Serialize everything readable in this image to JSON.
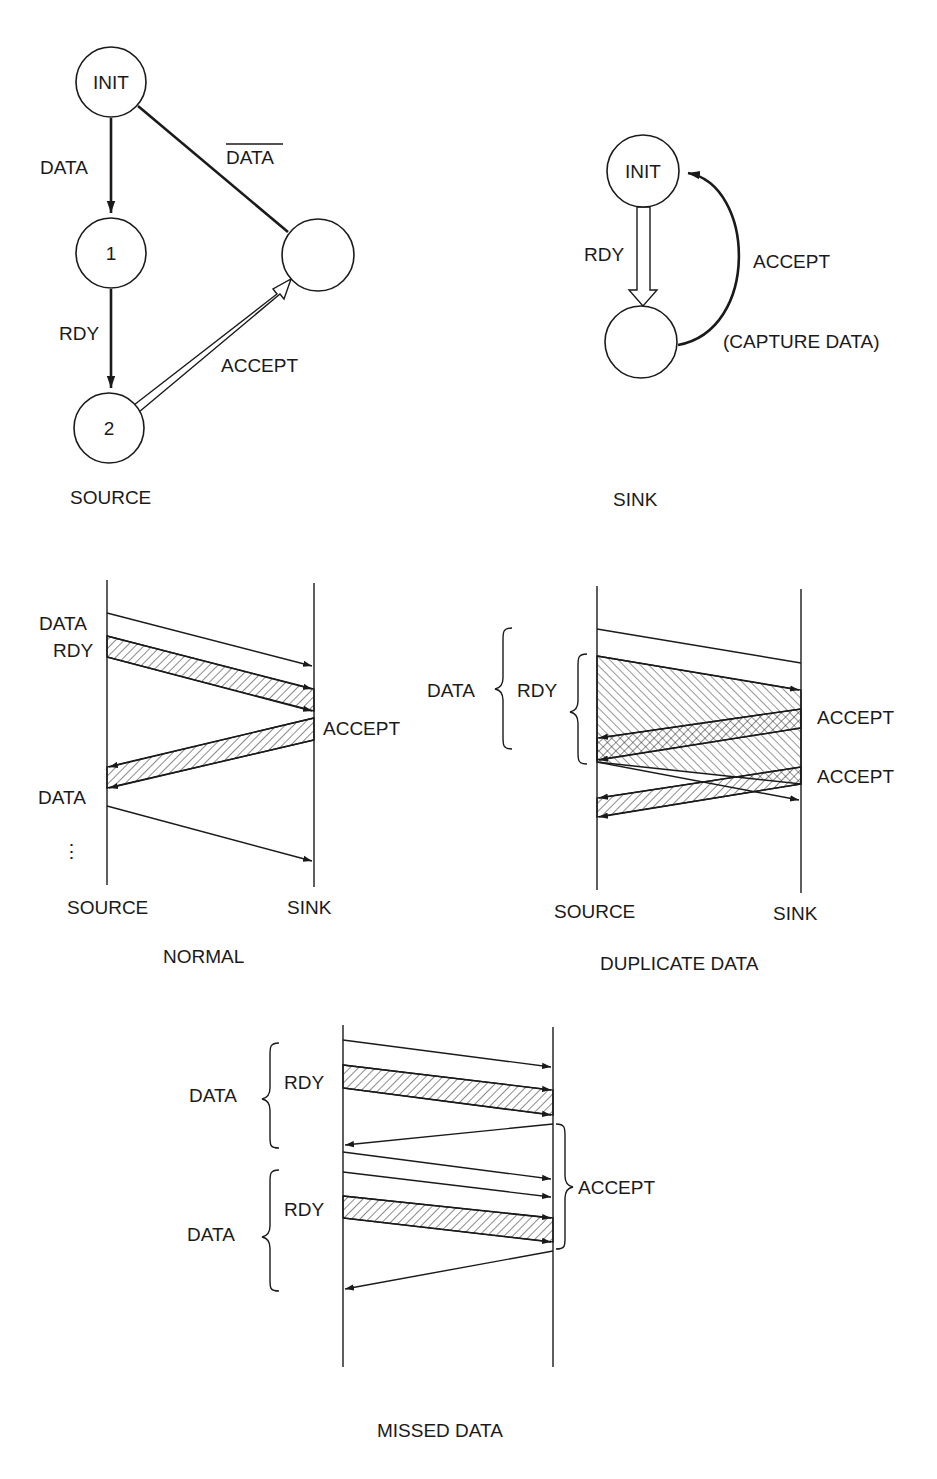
{
  "source_fsm": {
    "caption": "SOURCE",
    "nodes": {
      "init": "INIT",
      "one": "1",
      "two": "2",
      "unnamed": ""
    },
    "edges": {
      "init_to_1": "DATA",
      "init_to_unnamed": "DATA",
      "one_to_2": "RDY",
      "two_to_unnamed": "ACCEPT"
    },
    "overbar_on": "init_to_unnamed"
  },
  "sink_fsm": {
    "caption": "SINK",
    "nodes": {
      "init": "INIT",
      "unnamed": ""
    },
    "edges": {
      "init_to_unnamed": "RDY",
      "unnamed_to_init": "ACCEPT",
      "unnamed_to_init_note": "(CAPTURE DATA)"
    }
  },
  "normal": {
    "caption": "NORMAL",
    "source_label": "SOURCE",
    "sink_label": "SINK",
    "labels": {
      "data1": "DATA",
      "rdy": "RDY",
      "accept": "ACCEPT",
      "data2": "DATA",
      "ellipsis": "⋮"
    }
  },
  "duplicate": {
    "caption": "DUPLICATE DATA",
    "source_label": "SOURCE",
    "sink_label": "SINK",
    "labels": {
      "data": "DATA",
      "rdy": "RDY",
      "accept1": "ACCEPT",
      "accept2": "ACCEPT"
    }
  },
  "missed": {
    "caption": "MISSED DATA",
    "labels": {
      "data1": "DATA",
      "rdy1": "RDY",
      "data2": "DATA",
      "rdy2": "RDY",
      "accept": "ACCEPT"
    }
  },
  "colors": {
    "ink": "#1a1a1a",
    "paper": "#ffffff"
  }
}
